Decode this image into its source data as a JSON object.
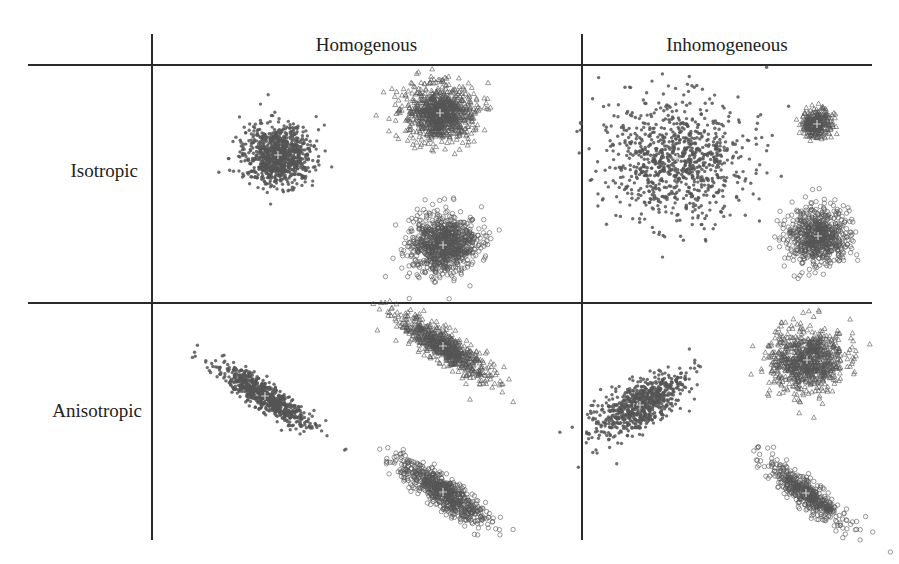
{
  "table": {
    "column_headers": [
      "Homogenous",
      "Inhomogeneous"
    ],
    "row_labels": [
      "Isotropic",
      "Anisotropic"
    ]
  },
  "chart_data": {
    "type": "scatter",
    "title": "",
    "layout": "2x2 grid of synthetic cluster scatter plots (rows: Isotropic/Anisotropic, columns: Homogenous/Inhomogeneous)",
    "grid": false,
    "legend": null,
    "marker_legend": {
      "star": "cluster 1 (filled star/dot)",
      "triangle": "cluster 2 (open triangle)",
      "circle": "cluster 3 (open circle)"
    },
    "point_color": "#555555",
    "center_marker": "+ (light gray)",
    "panels": [
      {
        "row": "Isotropic",
        "column": "Homogenous",
        "clusters": [
          {
            "marker": "star",
            "cx": 278,
            "cy": 155,
            "sx": 17,
            "sy": 15,
            "angle": 0,
            "n": 900
          },
          {
            "marker": "triangle",
            "cx": 440,
            "cy": 113,
            "sx": 17,
            "sy": 14,
            "angle": 0,
            "n": 900
          },
          {
            "marker": "circle",
            "cx": 443,
            "cy": 245,
            "sx": 17,
            "sy": 15,
            "angle": 0,
            "n": 900
          }
        ]
      },
      {
        "row": "Isotropic",
        "column": "Inhomogeneous",
        "clusters": [
          {
            "marker": "star",
            "cx": 677,
            "cy": 158,
            "sx": 35,
            "sy": 30,
            "angle": 0,
            "n": 900
          },
          {
            "marker": "triangle",
            "cx": 817,
            "cy": 124,
            "sx": 8,
            "sy": 7,
            "angle": 0,
            "n": 300
          },
          {
            "marker": "circle",
            "cx": 818,
            "cy": 236,
            "sx": 16,
            "sy": 14,
            "angle": 0,
            "n": 700
          }
        ]
      },
      {
        "row": "Anisotropic",
        "column": "Homogenous",
        "clusters": [
          {
            "marker": "star",
            "cx": 265,
            "cy": 396,
            "sx": 27,
            "sy": 6,
            "angle": 33,
            "n": 700
          },
          {
            "marker": "triangle",
            "cx": 443,
            "cy": 346,
            "sx": 27,
            "sy": 7,
            "angle": 33,
            "n": 700
          },
          {
            "marker": "circle",
            "cx": 443,
            "cy": 492,
            "sx": 26,
            "sy": 7,
            "angle": 35,
            "n": 700
          }
        ]
      },
      {
        "row": "Anisotropic",
        "column": "Inhomogeneous",
        "clusters": [
          {
            "marker": "star",
            "cx": 640,
            "cy": 405,
            "sx": 25,
            "sy": 11,
            "angle": -30,
            "n": 700
          },
          {
            "marker": "triangle",
            "cx": 807,
            "cy": 360,
            "sx": 19,
            "sy": 16,
            "angle": 0,
            "n": 800
          },
          {
            "marker": "circle",
            "cx": 806,
            "cy": 493,
            "sx": 24,
            "sy": 6,
            "angle": 38,
            "n": 500
          }
        ]
      }
    ]
  }
}
